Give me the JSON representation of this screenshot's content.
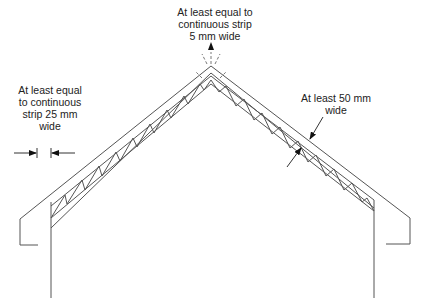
{
  "diagram": {
    "type": "roof-section-ventilation",
    "colors": {
      "line": "#555555",
      "text": "#222222",
      "background": "#ffffff"
    },
    "labels": {
      "ridge": {
        "lines": [
          "At least equal to",
          "continuous strip",
          "5 mm wide"
        ]
      },
      "eaves": {
        "lines": [
          "At least equal",
          "to continuous",
          "strip 25 mm",
          "wide"
        ]
      },
      "gap": {
        "lines": [
          "At least 50 mm",
          "wide"
        ]
      }
    },
    "dimensions": {
      "ridge_vent": "5 mm",
      "eaves_vent": "25 mm",
      "air_gap": "50 mm"
    }
  }
}
